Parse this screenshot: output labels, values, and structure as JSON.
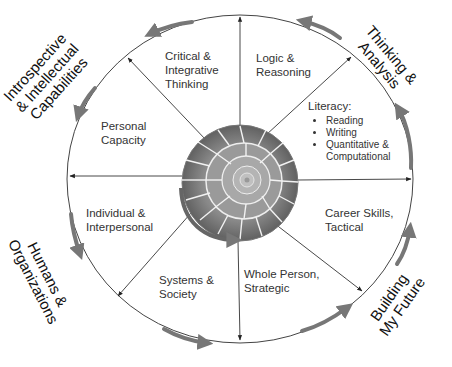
{
  "diagram": {
    "type": "circular-framework",
    "center_image": "nautilus-shell",
    "colors": {
      "arrow_gray": "#777777",
      "line": "#333333",
      "text": "#333333",
      "outer_text": "#111111"
    },
    "quadrants": [
      {
        "id": "thinking-analysis",
        "lines": [
          "Thinking &",
          "Analysis"
        ],
        "position": "top-right"
      },
      {
        "id": "building-future",
        "lines": [
          "Building",
          "My Future"
        ],
        "position": "bottom-right"
      },
      {
        "id": "humans-organizations",
        "lines": [
          "Humans &",
          "Organizations"
        ],
        "position": "bottom-left"
      },
      {
        "id": "introspective",
        "lines": [
          "Introspective",
          "& Intellectual",
          "Capabilities"
        ],
        "position": "top-left"
      }
    ],
    "segments": {
      "critical": {
        "lines": [
          "Critical &",
          "Integrative",
          "Thinking"
        ]
      },
      "logic": {
        "lines": [
          "Logic &",
          "Reasoning"
        ]
      },
      "literacy": {
        "title": "Literacy:",
        "items": [
          "Reading",
          "Writing",
          "Quantitative &",
          "Computational"
        ]
      },
      "personal": {
        "lines": [
          "Personal",
          "Capacity"
        ]
      },
      "individual": {
        "lines": [
          "Individual &",
          "Interpersonal"
        ]
      },
      "career": {
        "lines": [
          "Career Skills,",
          "Tactical"
        ]
      },
      "systems": {
        "lines": [
          "Systems &",
          "Society"
        ]
      },
      "whole": {
        "lines": [
          "Whole Person,",
          "Strategic"
        ]
      }
    }
  }
}
